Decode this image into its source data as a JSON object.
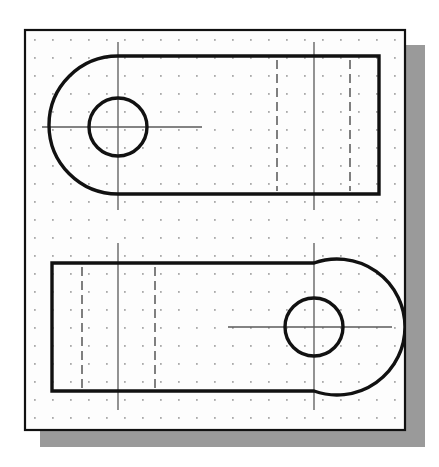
{
  "document": {
    "title": "Orthographic CAD Sketch",
    "description": "Two-view technical drawing of a slotted link / lever plate on a dotted grid sheet",
    "background_color": "#ffffff"
  },
  "canvas": {
    "width": 439,
    "height": 467
  },
  "sheet": {
    "name": "drawing-sheet",
    "x": 25,
    "y": 30,
    "width": 380,
    "height": 400,
    "fill_color": "#fdfdfd",
    "border_color": "#111111",
    "border_width": 2.2
  },
  "shadow": {
    "name": "sheet-drop-shadow",
    "x": 40,
    "y": 45,
    "width": 385,
    "height": 402,
    "color": "#9a9a9a"
  },
  "grid": {
    "name": "dot-grid",
    "spacing": 18.0,
    "origin_x": 34,
    "origin_y": 39,
    "dot_radius": 0.85,
    "dot_color": "#8d8d8d"
  },
  "line_styles": {
    "object_line_color": "#111111",
    "object_line_width": 3.4,
    "hidden_line_color": "#555555",
    "hidden_line_width": 1.5,
    "hidden_dash": "9,5",
    "center_line_color": "#5a5a5a",
    "center_line_width": 1.3,
    "center_dash": "none"
  },
  "chart_data": {
    "type": "diagram",
    "views": [
      {
        "name": "top-view",
        "label": "Top view — left-hand boss",
        "outline_type": "obround-left-rounded-rectangle",
        "left_arc_center_x": 118,
        "left_arc_center_y": 127,
        "arc_radius": 68,
        "body_top_y": 56,
        "body_bottom_y": 194,
        "body_right_x": 379,
        "body_left_tangent_x": 118,
        "hole": {
          "name": "bolt-hole",
          "center_x": 118,
          "center_y": 127,
          "radius": 29
        },
        "center_lines": {
          "horizontal": {
            "x1": 42,
            "x2": 202,
            "y": 127
          },
          "vertical": {
            "y1": 42,
            "y2": 210,
            "x": 118
          },
          "right_vertical": {
            "y1": 42,
            "y2": 210,
            "x": 314
          }
        },
        "hidden_lines": [
          {
            "x": 277,
            "y1": 60,
            "y2": 191
          },
          {
            "x": 350,
            "y1": 60,
            "y2": 191
          }
        ]
      },
      {
        "name": "front-view",
        "label": "Front view — right-hand boss",
        "outline_type": "obround-right-rounded-rectangle",
        "right_arc_center_x": 314,
        "right_arc_center_y": 327,
        "arc_radius": 68,
        "body_top_y": 263,
        "body_bottom_y": 391,
        "body_left_x": 52,
        "body_right_tangent_x": 314,
        "hole": {
          "name": "bolt-hole",
          "center_x": 314,
          "center_y": 327,
          "radius": 29
        },
        "center_lines": {
          "horizontal": {
            "x1": 228,
            "x2": 392,
            "y": 327
          },
          "vertical": {
            "y1": 243,
            "y2": 410,
            "x": 314
          },
          "left_vertical": {
            "y1": 243,
            "y2": 410,
            "x": 118
          }
        },
        "hidden_lines": [
          {
            "x": 82,
            "y1": 267,
            "y2": 388
          },
          {
            "x": 155,
            "y1": 267,
            "y2": 388
          }
        ]
      }
    ],
    "annotations": [],
    "legend": [],
    "grid_on": true
  }
}
